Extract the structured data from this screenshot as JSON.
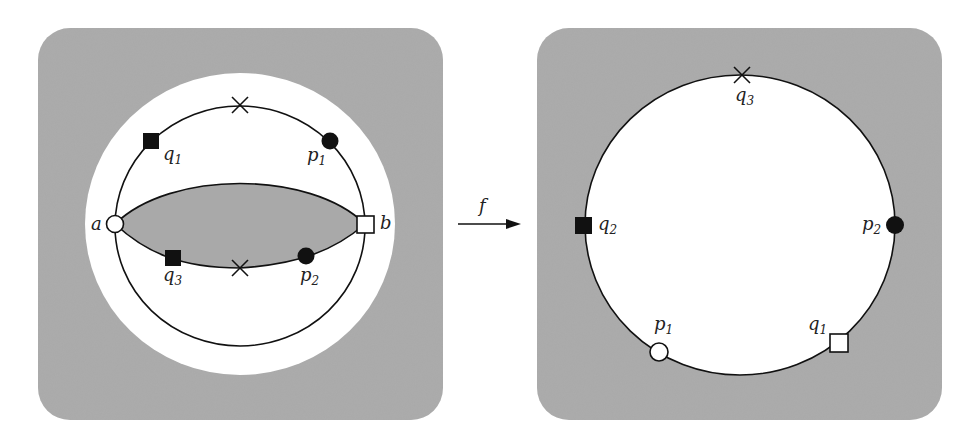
{
  "diagram": {
    "colors": {
      "panel_gray": "#a9a9a9",
      "white": "#ffffff",
      "stroke": "#111111"
    },
    "arrow": {
      "label": "f"
    },
    "left_panel": {
      "labels": {
        "a": "a",
        "b": "b",
        "q1": {
          "base": "q",
          "sub": "1"
        },
        "p1": {
          "base": "p",
          "sub": "1"
        },
        "q3": {
          "base": "q",
          "sub": "3"
        },
        "p2": {
          "base": "p",
          "sub": "2"
        }
      }
    },
    "right_panel": {
      "labels": {
        "q3": {
          "base": "q",
          "sub": "3"
        },
        "q2": {
          "base": "q",
          "sub": "2"
        },
        "p2": {
          "base": "p",
          "sub": "2"
        },
        "p1": {
          "base": "p",
          "sub": "1"
        },
        "q1": {
          "base": "q",
          "sub": "1"
        }
      }
    }
  }
}
